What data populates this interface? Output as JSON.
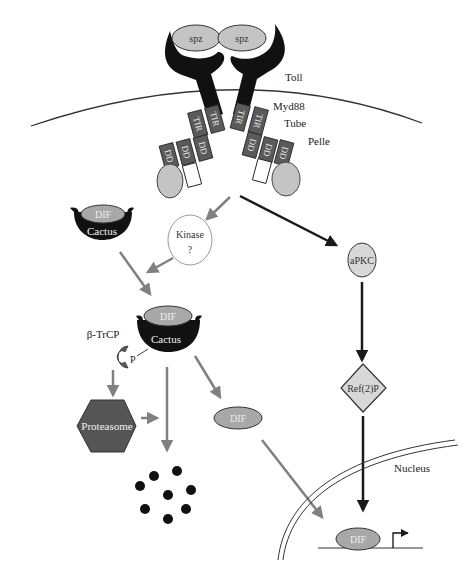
{
  "diagram": {
    "colors": {
      "receptor": "#111111",
      "domain_box": "#5a5a5a",
      "node_fill": "#c4c4c4",
      "grey_arrow": "#808080",
      "black_arrow": "#1a1a1a",
      "membrane": "#333333"
    },
    "receptor": {
      "ligands": [
        "spz",
        "spz"
      ],
      "label_toll": "Toll",
      "label_myd88": "Myd88",
      "label_tube": "Tube",
      "label_pelle": "Pelle",
      "tir_label": "TIR",
      "dd_label": "DD"
    },
    "complex_top": {
      "dif": "DIF",
      "cactus": "Cactus"
    },
    "kinase": {
      "line1": "Kinase",
      "line2": "?"
    },
    "complex_mid": {
      "dif": "DIF",
      "cactus": "Cactus",
      "btrcp": "β-TrCP",
      "p": "P"
    },
    "proteasome": "Proteasome",
    "dif_free": "DIF",
    "apkc": "aPKC",
    "ref2p": "Ref(2)P",
    "nucleus": "Nucleus",
    "dif_nuclear": "DIF"
  }
}
